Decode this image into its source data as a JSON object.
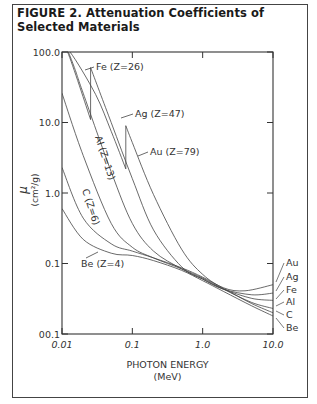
{
  "figure": {
    "title": "FIGURE 2. Attenuation Coefficients of Selected Materials"
  },
  "chart_data": {
    "type": "line",
    "title": "FIGURE 2. Attenuation Coefficients of Selected Materials",
    "xlabel": "PHOTON ENERGY",
    "xlabel_unit": "(MeV)",
    "ylabel": "μ",
    "ylabel_unit": "(cm²/g)",
    "xscale": "log",
    "yscale": "log",
    "xlim": [
      0.01,
      10.0
    ],
    "ylim": [
      0.01,
      100.0
    ],
    "x_ticks": [
      "0.01",
      "0.1",
      "1.0",
      "10.0"
    ],
    "y_ticks": [
      "00.1",
      "0.1",
      "1.0",
      "10.0",
      "100.0"
    ],
    "grid": false,
    "legend": "inline labels",
    "annotations": [
      "Fe (Z=26)",
      "Ag (Z=47)",
      "Au (Z=79)",
      "Al (Z=13)",
      "C (Z=6)",
      "Be (Z=4)"
    ],
    "right_labels": [
      "Au",
      "Ag",
      "Fe",
      "Al",
      "C",
      "Be"
    ],
    "series": [
      {
        "name": "Au",
        "Z": 79,
        "points": [
          [
            0.01,
            100
          ],
          [
            0.013,
            100
          ],
          [
            0.03,
            25
          ],
          [
            0.05,
            7.5
          ],
          [
            0.0808,
            2.2
          ],
          [
            0.0808,
            9.0
          ],
          [
            0.1,
            5.2
          ],
          [
            0.2,
            0.95
          ],
          [
            0.5,
            0.16
          ],
          [
            1.0,
            0.07
          ],
          [
            2.0,
            0.045
          ],
          [
            4.0,
            0.041
          ],
          [
            10.0,
            0.05
          ]
        ]
      },
      {
        "name": "Ag",
        "Z": 47,
        "points": [
          [
            0.01,
            100
          ],
          [
            0.012,
            100
          ],
          [
            0.0255,
            11
          ],
          [
            0.0255,
            60
          ],
          [
            0.05,
            10
          ],
          [
            0.1,
            1.6
          ],
          [
            0.2,
            0.3
          ],
          [
            0.5,
            0.09
          ],
          [
            1.0,
            0.06
          ],
          [
            2.0,
            0.043
          ],
          [
            5.0,
            0.036
          ],
          [
            10.0,
            0.038
          ]
        ]
      },
      {
        "name": "Fe",
        "Z": 26,
        "points": [
          [
            0.01,
            170
          ],
          [
            0.015,
            60
          ],
          [
            0.02,
            26
          ],
          [
            0.05,
            2.0
          ],
          [
            0.1,
            0.37
          ],
          [
            0.2,
            0.15
          ],
          [
            0.5,
            0.084
          ],
          [
            1.0,
            0.06
          ],
          [
            2.0,
            0.043
          ],
          [
            5.0,
            0.032
          ],
          [
            10.0,
            0.03
          ]
        ]
      },
      {
        "name": "Al",
        "Z": 13,
        "points": [
          [
            0.01,
            26
          ],
          [
            0.02,
            3.4
          ],
          [
            0.05,
            0.37
          ],
          [
            0.1,
            0.17
          ],
          [
            0.2,
            0.12
          ],
          [
            0.5,
            0.084
          ],
          [
            1.0,
            0.062
          ],
          [
            2.0,
            0.043
          ],
          [
            5.0,
            0.028
          ],
          [
            10.0,
            0.023
          ]
        ]
      },
      {
        "name": "C",
        "Z": 6,
        "points": [
          [
            0.01,
            2.3
          ],
          [
            0.02,
            0.44
          ],
          [
            0.05,
            0.19
          ],
          [
            0.1,
            0.15
          ],
          [
            0.2,
            0.12
          ],
          [
            0.5,
            0.087
          ],
          [
            1.0,
            0.064
          ],
          [
            2.0,
            0.044
          ],
          [
            5.0,
            0.027
          ],
          [
            10.0,
            0.02
          ]
        ]
      },
      {
        "name": "Be",
        "Z": 4,
        "points": [
          [
            0.01,
            0.6
          ],
          [
            0.02,
            0.22
          ],
          [
            0.05,
            0.14
          ],
          [
            0.1,
            0.13
          ],
          [
            0.2,
            0.11
          ],
          [
            0.5,
            0.08
          ],
          [
            1.0,
            0.057
          ],
          [
            2.0,
            0.04
          ],
          [
            5.0,
            0.025
          ],
          [
            10.0,
            0.018
          ]
        ]
      }
    ]
  }
}
